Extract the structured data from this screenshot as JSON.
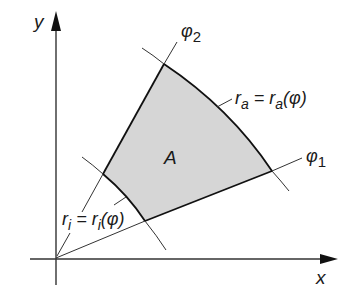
{
  "diagram": {
    "type": "polar-region-area",
    "colors": {
      "background": "#ffffff",
      "region_fill": "#d6d6d6",
      "stroke": "#222222",
      "thin_stroke": "#333333"
    },
    "axes": {
      "x_label": "x",
      "y_label": "y"
    },
    "region": {
      "label": "A"
    },
    "rays": {
      "phi1": {
        "label_base": "φ",
        "label_sub": "1"
      },
      "phi2": {
        "label_base": "φ",
        "label_sub": "2"
      }
    },
    "curves": {
      "outer": {
        "lhs_base": "r",
        "lhs_sub": "a",
        "eq": " = ",
        "rhs_base": "r",
        "rhs_sub": "a",
        "rhs_arg": "(φ)"
      },
      "inner": {
        "lhs_base": "r",
        "lhs_sub": "i",
        "eq": " = ",
        "rhs_base": "r",
        "rhs_sub": "i",
        "rhs_arg": "(φ)"
      }
    }
  }
}
